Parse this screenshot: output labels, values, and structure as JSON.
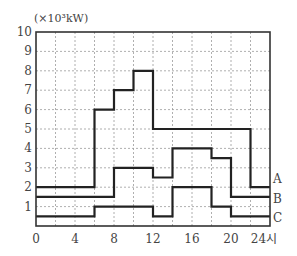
{
  "chart_data": {
    "type": "line",
    "subtype": "step",
    "title": "",
    "ylabel": "(×10³kW)",
    "xlabel": "시",
    "xlim": [
      0,
      24
    ],
    "ylim": [
      0,
      10
    ],
    "x_ticks": [
      0,
      4,
      8,
      12,
      16,
      20,
      24
    ],
    "x_tick_labels": [
      "0",
      "4",
      "8",
      "12",
      "16",
      "20",
      "24시"
    ],
    "y_ticks": [
      1,
      2,
      3,
      4,
      5,
      6,
      7,
      8,
      9,
      10
    ],
    "y_tick_labels": [
      "1",
      "2",
      "3",
      "4",
      "5",
      "6",
      "7",
      "8",
      "9",
      "10"
    ],
    "grid": true,
    "grid_x_step": 2,
    "grid_y_step": 1,
    "legend_position": "right-end-labels",
    "series": [
      {
        "name": "A",
        "steps": [
          [
            0,
            6,
            2
          ],
          [
            6,
            8,
            6
          ],
          [
            8,
            10,
            7
          ],
          [
            10,
            12,
            8
          ],
          [
            12,
            22,
            5
          ],
          [
            22,
            24,
            2
          ]
        ]
      },
      {
        "name": "B",
        "steps": [
          [
            0,
            8,
            1.5
          ],
          [
            8,
            12,
            3
          ],
          [
            12,
            14,
            2.5
          ],
          [
            14,
            18,
            4
          ],
          [
            18,
            20,
            3.5
          ],
          [
            20,
            24,
            1.5
          ]
        ]
      },
      {
        "name": "C",
        "steps": [
          [
            0,
            6,
            0.5
          ],
          [
            6,
            12,
            1
          ],
          [
            12,
            14,
            0.5
          ],
          [
            14,
            18,
            2
          ],
          [
            18,
            20,
            1
          ],
          [
            20,
            24,
            0.5
          ]
        ]
      }
    ]
  },
  "colors": {
    "line": "#222222",
    "grid": "#9a9a9a",
    "axis": "#333333"
  }
}
